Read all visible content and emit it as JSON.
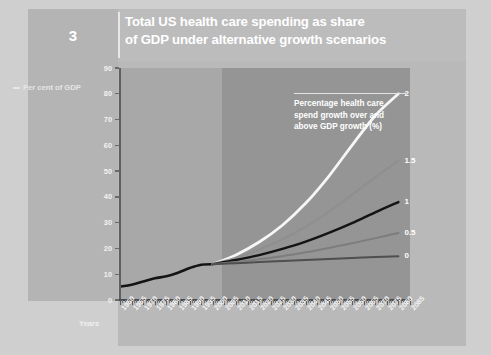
{
  "figure": {
    "number": "3",
    "title_line1": "Total US health care spending as share",
    "title_line2": "of GDP under alternative growth scenarios"
  },
  "annotation": {
    "line1": "Percentage health care",
    "line2": "spend growth over and",
    "line3": "above GDP growth (%)"
  },
  "axes": {
    "y_title": "Per cent of GDP",
    "x_title": "Years"
  },
  "colors": {
    "page_background": "#cfcfcf",
    "panel_left": "#b4b4b4",
    "panel_main": "#b9b9b9",
    "plot_historical": "#a8a8a8",
    "plot_projection": "#959595",
    "title_text": "#ffffff",
    "series_2": "#f6f6f6",
    "series_1_5": "#8f8f8f",
    "series_1": "#141414",
    "series_0_5": "#7d7d7d",
    "series_0": "#4f4f4f"
  },
  "chart_data": {
    "type": "line",
    "title": "Total US health care spending as share of GDP under alternative growth scenarios",
    "xlabel": "Years",
    "ylabel": "Per cent of GDP",
    "ylim": [
      0,
      90
    ],
    "yticks": [
      0,
      10,
      20,
      30,
      40,
      50,
      60,
      70,
      80,
      90
    ],
    "xlim": [
      1960,
      2085
    ],
    "xticks": [
      1960,
      1965,
      1970,
      1975,
      1980,
      1985,
      1990,
      1995,
      2000,
      2005,
      2010,
      2015,
      2020,
      2025,
      2030,
      2035,
      2040,
      2045,
      2050,
      2055,
      2060,
      2065,
      2070,
      2075,
      2080,
      2085
    ],
    "grid": false,
    "legend_position": "right-of-line-ends",
    "projection_starts": 2000,
    "series": [
      {
        "name": "Historical",
        "label": "",
        "color": "#141414",
        "x": [
          1960,
          1965,
          1970,
          1975,
          1980,
          1985,
          1990,
          1995,
          2000
        ],
        "values": [
          5.2,
          5.9,
          7.2,
          8.4,
          9.2,
          10.6,
          12.4,
          13.7,
          13.9
        ]
      },
      {
        "name": "2",
        "label": "2",
        "color": "#f6f6f6",
        "x": [
          2000,
          2010,
          2020,
          2030,
          2040,
          2050,
          2060,
          2070,
          2080
        ],
        "values": [
          13.9,
          17.5,
          22.5,
          29.0,
          37.5,
          48.0,
          60.0,
          71.5,
          80.0
        ]
      },
      {
        "name": "1.5",
        "label": "1.5",
        "color": "#8f8f8f",
        "x": [
          2000,
          2010,
          2020,
          2030,
          2040,
          2050,
          2060,
          2070,
          2080
        ],
        "values": [
          13.9,
          16.4,
          19.6,
          23.6,
          28.4,
          34.2,
          40.8,
          47.6,
          54.0
        ]
      },
      {
        "name": "1",
        "label": "1",
        "color": "#141414",
        "x": [
          2000,
          2010,
          2020,
          2030,
          2040,
          2050,
          2060,
          2070,
          2080
        ],
        "values": [
          13.9,
          15.5,
          17.4,
          19.8,
          22.6,
          26.0,
          29.8,
          34.0,
          38.0
        ]
      },
      {
        "name": "0.5",
        "label": "0.5",
        "color": "#7d7d7d",
        "x": [
          2000,
          2010,
          2020,
          2030,
          2040,
          2050,
          2060,
          2070,
          2080
        ],
        "values": [
          13.9,
          14.7,
          15.8,
          17.0,
          18.5,
          20.2,
          22.0,
          24.0,
          26.0
        ]
      },
      {
        "name": "0",
        "label": "0",
        "color": "#4f4f4f",
        "x": [
          2000,
          2010,
          2020,
          2030,
          2040,
          2050,
          2060,
          2070,
          2080
        ],
        "values": [
          13.9,
          14.3,
          14.7,
          15.1,
          15.5,
          15.9,
          16.3,
          16.7,
          17.0
        ]
      }
    ]
  }
}
